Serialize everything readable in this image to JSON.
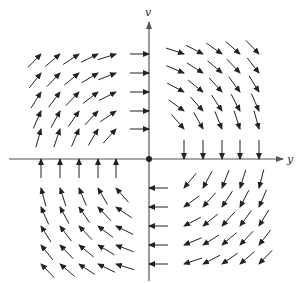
{
  "figure": {
    "type": "vector-field",
    "width": 301,
    "height": 283,
    "origin_px": [
      149,
      159
    ],
    "colors": {
      "axis": "#555555",
      "arrow": "#222222",
      "background": "#ffffff"
    }
  },
  "axes": {
    "horizontal": {
      "label": "y",
      "from_px": 9,
      "to_px": 283,
      "label_pos_px": [
        287,
        163
      ]
    },
    "vertical": {
      "label": "v",
      "from_px": 281,
      "to_px": 22,
      "label_pos_px": [
        145,
        16
      ]
    }
  },
  "grid": {
    "x_px": [
      41,
      60,
      79,
      98,
      116,
      149,
      184,
      203,
      222,
      240,
      259
    ],
    "y_px": [
      54,
      73,
      92,
      111,
      129,
      159,
      188,
      207,
      226,
      245,
      264
    ],
    "arrow_length_px": 19,
    "field": "clockwise rotation: d(horizontal)/dt = v, d(v)/dt = -y"
  }
}
